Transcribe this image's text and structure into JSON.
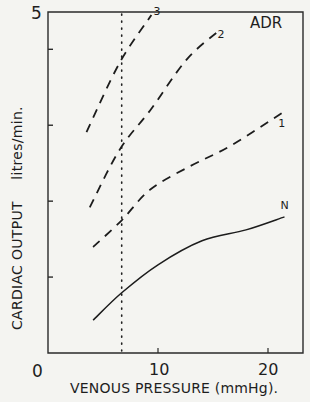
{
  "chart_data": {
    "type": "line",
    "title": "",
    "xlabel": "VENOUS PRESSURE (mmHg).",
    "ylabel": "CARDIAC OUTPUT",
    "ylabel_units": "litres/min.",
    "panel_label": "ADR",
    "xlim": [
      0,
      23
    ],
    "ylim": [
      0,
      5
    ],
    "origin_label": "0",
    "x_ticks": [
      10,
      20
    ],
    "x_tick_labels": [
      "10",
      "20"
    ],
    "y_tick_labels": [
      "5"
    ],
    "y_minor_ticks": [
      1.11,
      2.22,
      3.33,
      4.44
    ],
    "grid": false,
    "legend": "inline curve labels",
    "reference_line": {
      "type": "vertical",
      "style": "dotted",
      "x": 6.7
    },
    "series": [
      {
        "name": "N",
        "label": "N",
        "style": "solid",
        "x": [
          4.1,
          6.7,
          10,
          14,
          18,
          21.5
        ],
        "y": [
          0.48,
          0.88,
          1.29,
          1.64,
          1.8,
          1.99
        ]
      },
      {
        "name": "1",
        "label": "1",
        "style": "dashed",
        "x": [
          4.1,
          6.7,
          9.3,
          12.9,
          16.5,
          21.3
        ],
        "y": [
          1.55,
          1.94,
          2.39,
          2.73,
          3.02,
          3.51
        ]
      },
      {
        "name": "2",
        "label": "2",
        "style": "dashed",
        "x": [
          3.8,
          6.5,
          9.3,
          12.6,
          15.6
        ],
        "y": [
          2.13,
          2.97,
          3.55,
          4.29,
          4.72
        ]
      },
      {
        "name": "3",
        "label": "3",
        "style": "dashed",
        "x": [
          3.5,
          6.5,
          9.4
        ],
        "y": [
          3.23,
          4.24,
          4.94
        ]
      }
    ]
  },
  "colors": {
    "background": "#f4f4f1",
    "ink": "#1c1c1c"
  }
}
